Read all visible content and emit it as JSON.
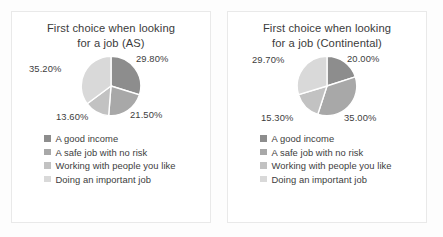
{
  "background_color": "#fdfdfd",
  "panel_background": "#ffffff",
  "panel_border_color": "#e9e9e9",
  "text_color": "#3d3d3d",
  "series_colors": [
    "#8d8d8d",
    "#a8a8a8",
    "#c2c2c2",
    "#d9d9d9"
  ],
  "legend": {
    "items": [
      {
        "label": "A good income",
        "color": "#8d8d8d"
      },
      {
        "label": "A safe job with no risk",
        "color": "#a8a8a8"
      },
      {
        "label": "Working with people you like",
        "color": "#c2c2c2"
      },
      {
        "label": "Doing an important job",
        "color": "#d9d9d9"
      }
    ]
  },
  "chart_data": [
    {
      "type": "pie",
      "title": "First choice when looking for a job (AS)",
      "title_line1": "First choice when looking",
      "title_line2": "for a job (AS)",
      "categories": [
        "A good income",
        "A safe job with no risk",
        "Working with people you like",
        "Doing an important job"
      ],
      "values": [
        29.8,
        21.5,
        13.6,
        35.2
      ],
      "labels": [
        "29.80%",
        "21.50%",
        "13.60%",
        "35.20%"
      ],
      "colors": [
        "#8d8d8d",
        "#a8a8a8",
        "#c2c2c2",
        "#d9d9d9"
      ],
      "start_angle": 0,
      "legend_position": "bottom",
      "grid": false,
      "xlabel": "",
      "ylabel": ""
    },
    {
      "type": "pie",
      "title": "First choice when looking for a job (Continental)",
      "title_line1": "First choice when looking",
      "title_line2": "for a job (Continental)",
      "categories": [
        "A good income",
        "A safe job with no risk",
        "Working with people you like",
        "Doing an important job"
      ],
      "values": [
        20.0,
        35.0,
        15.3,
        29.7
      ],
      "labels": [
        "20.00%",
        "35.00%",
        "15.30%",
        "29.70%"
      ],
      "colors": [
        "#8d8d8d",
        "#a8a8a8",
        "#c2c2c2",
        "#d9d9d9"
      ],
      "start_angle": 0,
      "legend_position": "bottom",
      "grid": false,
      "xlabel": "",
      "ylabel": ""
    }
  ]
}
